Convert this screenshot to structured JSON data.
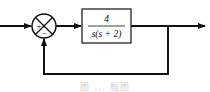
{
  "diagram": {
    "type": "block-diagram",
    "summing_junction": {
      "signs": {
        "left": "+",
        "bottom": "−"
      }
    },
    "forward_block": {
      "numerator": "4",
      "denominator": "s(s + 2)"
    },
    "caption": "图 ... 框图",
    "colors": {
      "line": "#111111",
      "background": "#ffffff",
      "caption": "#d0d0d0"
    }
  }
}
